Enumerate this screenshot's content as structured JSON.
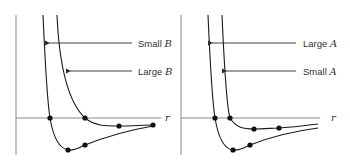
{
  "figure": {
    "left_panel": {
      "axis_label": "r",
      "annotations": [
        {
          "prefix": "Small ",
          "var": "B"
        },
        {
          "prefix": "Large ",
          "var": "B"
        }
      ]
    },
    "right_panel": {
      "axis_label": "r",
      "annotations": [
        {
          "prefix": "Large ",
          "var": "A"
        },
        {
          "prefix": "Small ",
          "var": "A"
        }
      ]
    }
  },
  "colors": {
    "curve": "#1a1a1a",
    "axis": "#8a8a8a",
    "text": "#333333",
    "background": "#ffffff"
  }
}
